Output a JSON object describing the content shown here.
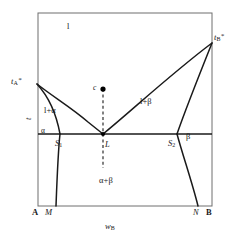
{
  "figure": {
    "type": "phase-diagram",
    "colors": {
      "line": "#1a1a1a",
      "background": "#ffffff",
      "point": "#000000"
    }
  },
  "axes": {
    "y_label": "t",
    "x_label_main": "w",
    "x_label_sub": "B",
    "x_left_component": "A",
    "x_right_component": "B",
    "x_left_tick_label": "M",
    "x_right_tick_label": "N"
  },
  "regions": [
    {
      "id": "liquid",
      "label": "l",
      "x": 67,
      "y": 22
    },
    {
      "id": "liquid-plus-alpha",
      "label": "l+α",
      "x": 51,
      "y": 110
    },
    {
      "id": "liquid-plus-beta",
      "label": "l+β",
      "x": 147,
      "y": 101
    },
    {
      "id": "alpha",
      "label": "α",
      "x": 41,
      "y": 131
    },
    {
      "id": "beta",
      "label": "β",
      "x": 188,
      "y": 137
    },
    {
      "id": "alpha-plus-beta",
      "label": "α+β",
      "x": 106,
      "y": 181
    }
  ],
  "points": [
    {
      "id": "melting-point-A",
      "label_main": "t",
      "label_sub": "A",
      "label_sup": "*",
      "x": 37,
      "y": 84,
      "lx": 11,
      "ly": 78
    },
    {
      "id": "melting-point-B",
      "label_main": "t",
      "label_sub": "B",
      "label_sup": "*",
      "x": 212,
      "y": 43,
      "lx": 215,
      "ly": 34
    },
    {
      "id": "solidus-point-S1",
      "label_main": "S",
      "label_sub": "1",
      "x": 60,
      "y": 134,
      "lx": 56,
      "ly": 140
    },
    {
      "id": "solidus-point-S2",
      "label_main": "S",
      "label_sub": "2",
      "x": 177,
      "y": 134,
      "lx": 169,
      "ly": 140
    },
    {
      "id": "eutectic-point-L",
      "label_main": "L",
      "x": 103,
      "y": 134,
      "lx": 105,
      "ly": 141
    },
    {
      "id": "composition-point-c",
      "label_main": "c",
      "x": 103,
      "y": 89,
      "lx": 93,
      "ly": 84
    }
  ],
  "curves": {
    "box": {
      "left": 38,
      "top": 13,
      "right": 212,
      "bottom": 206
    },
    "eutectic_line": {
      "x1": 38,
      "x2": 212,
      "y": 134
    },
    "liquidus_left": "M37,84 C 52,96 72,108 88,122 L103,134",
    "liquidus_right": "M103,134 C 130,112 172,73 212,43",
    "solidus_alpha": "M37,84 C 48,96 56,112 60,134",
    "solvus_alpha": "M60,134 C 58,152 57,180 56,206",
    "solidus_beta": "M212,43 C 200,73 186,108 177,134",
    "solvus_beta": "M177,134 C 183,156 192,182 198,206",
    "dashed_isopleth": {
      "x": 103,
      "y_top": 89,
      "y_bottom": 168
    }
  }
}
